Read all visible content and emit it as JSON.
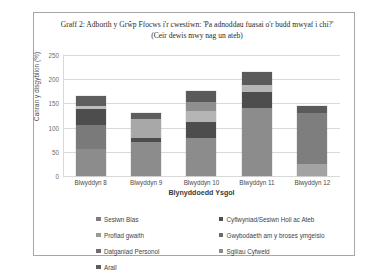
{
  "chart_data": {
    "type": "bar",
    "stacked": true,
    "title": "Graff 2: Adborth y Grŵp Ffocws i'r cwestiwn: 'Pa adnoddau fuasai o'r budd mwyaf i chi?' (Ceir dewis mwy nag un ateb)",
    "xlabel": "Blynyddoedd Ysgol",
    "ylabel": "Canran y disgyblion (%)",
    "ylim": [
      0,
      250
    ],
    "yticks": [
      0,
      50,
      100,
      150,
      200,
      250
    ],
    "grid": true,
    "legend_position": "bottom",
    "categories": [
      "Blwyddyn 8",
      "Blwyddyn 9",
      "Blwyddyn 10",
      "Blwyddyn 11",
      "Blwyddyn 12"
    ],
    "series": [
      {
        "name": "Sesiwn Blas",
        "color": "#808080",
        "values": [
          55,
          70,
          78,
          140,
          25
        ]
      },
      {
        "name": "Cyflwyniad/Sesiwn Holi ac Ateb",
        "color": "#9e9e9e",
        "values": [
          50,
          8,
          57,
          33,
          105
        ]
      },
      {
        "name": "Profiad gwaith",
        "color": "#505050",
        "values": [
          33,
          40,
          23,
          15,
          15
        ]
      },
      {
        "name": "Gwybodaeth am y broses ymgeisio",
        "color": "#bfbfbf",
        "values": [
          7,
          12,
          17,
          27,
          0
        ]
      },
      {
        "name": "Datganiad Personol",
        "color": "#6b6b6b",
        "values": [
          20,
          0,
          0,
          0,
          0
        ]
      },
      {
        "name": "Sgiliau Cyfweld",
        "color": "#595959",
        "values": [
          0,
          0,
          0,
          0,
          0
        ]
      },
      {
        "name": "Arall",
        "color": "#737373",
        "values": [
          0,
          0,
          0,
          0,
          0
        ]
      }
    ],
    "totals": [
      165,
      130,
      175,
      215,
      145
    ]
  },
  "chart": {
    "title": "Graff 2: Adborth y Grŵp Ffocws i'r cwestiwn: 'Pa adnoddau fuasai o'r budd mwyaf i chi?' (Ceir dewis mwy nag un ateb)",
    "yaxis_title": "Canran y disgyblion (%)",
    "xaxis_title": "Blynyddoedd Ysgol",
    "yticks": [
      "250",
      "200",
      "150",
      "100",
      "50",
      "0"
    ],
    "xlabels": [
      "Blwyddyn 8",
      "Blwyddyn 9",
      "Blwyddyn 10",
      "Blwyddyn 11",
      "Blwyddyn 12"
    ],
    "legend": {
      "left_column": [
        "Sesiwn Blas",
        "Profiad gwaith",
        "Datganiad Personol",
        "Arall"
      ],
      "right_column": [
        "Cyflwyniad/Sesiwn Holi ac Ateb",
        "Gwybodaeth am y broses ymgeisio",
        "Sgiliau Cyfweld"
      ]
    },
    "legend_colors": {
      "left_column": [
        "#7d7d7d",
        "#9a9a9a",
        "#6e6e6e",
        "#5c5c5c"
      ],
      "right_column": [
        "#4f4f4f",
        "#6b6b6b",
        "#8a8a8a"
      ]
    }
  },
  "bars": [
    {
      "label": "Blwyddyn 8",
      "total": 165,
      "segments": [
        {
          "value": 55,
          "color": "#8c8c8c"
        },
        {
          "value": 50,
          "color": "#7a7a7a"
        },
        {
          "value": 33,
          "color": "#4d4d4d"
        },
        {
          "value": 7,
          "color": "#bdbdbd"
        },
        {
          "value": 20,
          "color": "#5e5e5e"
        }
      ]
    },
    {
      "label": "Blwyddyn 9",
      "total": 130,
      "segments": [
        {
          "value": 70,
          "color": "#8c8c8c"
        },
        {
          "value": 8,
          "color": "#4d4d4d"
        },
        {
          "value": 40,
          "color": "#a8a8a8"
        },
        {
          "value": 12,
          "color": "#5e5e5e"
        }
      ]
    },
    {
      "label": "Blwyddyn 10",
      "total": 175,
      "segments": [
        {
          "value": 78,
          "color": "#8c8c8c"
        },
        {
          "value": 34,
          "color": "#4d4d4d"
        },
        {
          "value": 23,
          "color": "#b5b5b5"
        },
        {
          "value": 17,
          "color": "#8f8f8f"
        },
        {
          "value": 23,
          "color": "#5a5a5a"
        }
      ]
    },
    {
      "label": "Blwyddyn 11",
      "total": 215,
      "segments": [
        {
          "value": 140,
          "color": "#8c8c8c"
        },
        {
          "value": 33,
          "color": "#4d4d4d"
        },
        {
          "value": 15,
          "color": "#b5b5b5"
        },
        {
          "value": 27,
          "color": "#5a5a5a"
        }
      ]
    },
    {
      "label": "Blwyddyn 12",
      "total": 145,
      "segments": [
        {
          "value": 25,
          "color": "#a3a3a3"
        },
        {
          "value": 105,
          "color": "#7e7e7e"
        },
        {
          "value": 15,
          "color": "#5a5a5a"
        }
      ]
    }
  ]
}
